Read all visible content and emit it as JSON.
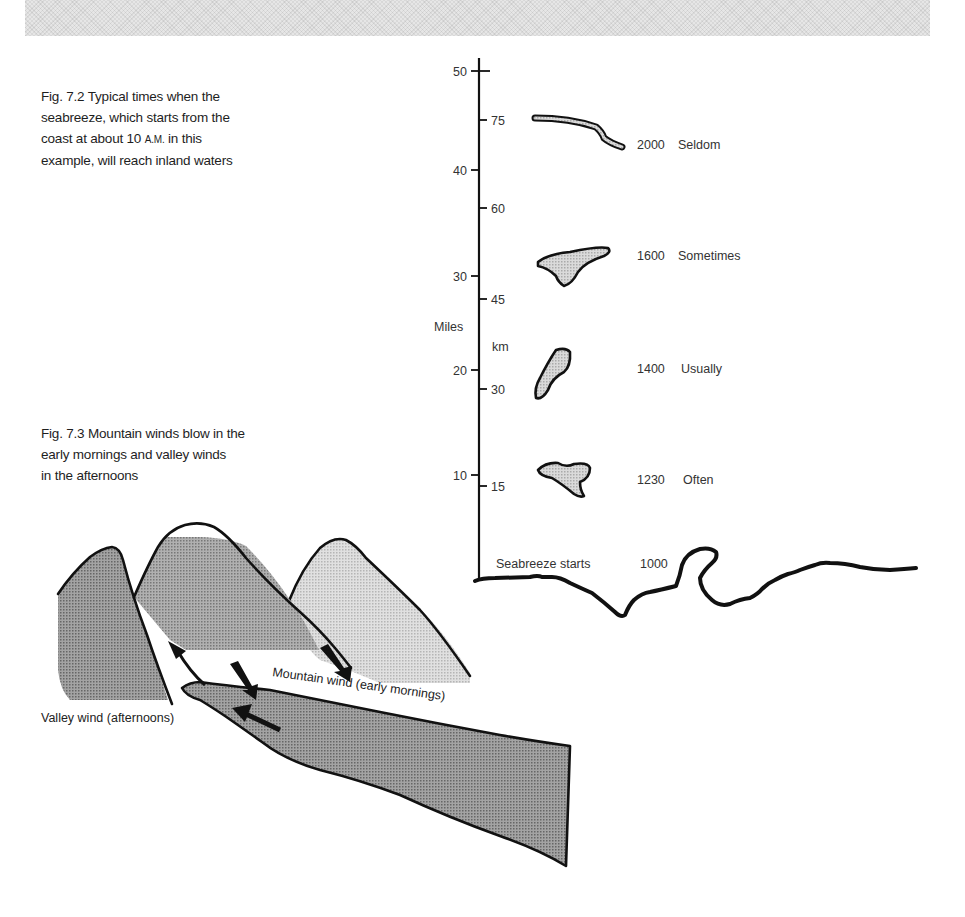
{
  "banner": {
    "pattern": "halftone-gray"
  },
  "figure_7_2": {
    "caption_lines": [
      "Fig. 7.2  Typical times when the",
      "seabreeze, which starts from the",
      "coast at about 10 ",
      "A.M.",
      " in this",
      "example, will reach inland waters"
    ],
    "axis": {
      "miles_label": "Miles",
      "km_label": "km",
      "miles_ticks": [
        "50",
        "40",
        "30",
        "20",
        "10"
      ],
      "km_ticks": [
        "75",
        "60",
        "45",
        "30",
        "15"
      ]
    },
    "rows": [
      {
        "time": "2000",
        "frequency": "Seldom"
      },
      {
        "time": "1600",
        "frequency": "Sometimes"
      },
      {
        "time": "1400",
        "frequency": "Usually"
      },
      {
        "time": "1230",
        "frequency": "Often"
      }
    ],
    "start": {
      "label": "Seabreeze starts",
      "time": "1000"
    },
    "colors": {
      "ink": "#111111",
      "fill": "#cfcfcf"
    }
  },
  "figure_7_3": {
    "caption_lines": [
      "Fig. 7.3  Mountain winds blow in the",
      "early mornings and valley winds",
      "in the afternoons"
    ],
    "labels": {
      "mountain_wind": "Mountain wind (early mornings)",
      "valley_wind": "Valley wind (afternoons)"
    },
    "colors": {
      "dark": "#8a8a8a",
      "mid": "#9a9a9a",
      "light": "#d2d2d2",
      "ink": "#111111"
    }
  }
}
